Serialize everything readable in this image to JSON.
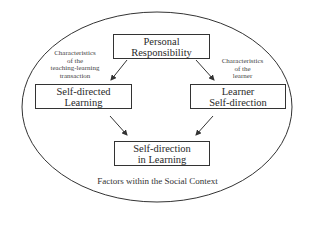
{
  "diagram": {
    "nodes": {
      "personal_responsibility": {
        "line1": "Personal",
        "line2": "Responsibility"
      },
      "self_directed_learning": {
        "line1": "Self-directed",
        "line2": "Learning"
      },
      "learner_self_direction": {
        "line1": "Learner",
        "line2": "Self-direction"
      },
      "self_direction_in_learning": {
        "line1": "Self-direction",
        "line2": "in Learning"
      }
    },
    "edge_labels": {
      "left": {
        "line1": "Characteristics",
        "line2": "of the",
        "line3": "teaching-learning",
        "line4": "transaction"
      },
      "right": {
        "line1": "Characteristics",
        "line2": "of the",
        "line3": "learner"
      }
    },
    "container_label": "Factors within the Social Context",
    "edges": [
      {
        "from": "personal_responsibility",
        "to": "self_directed_learning"
      },
      {
        "from": "personal_responsibility",
        "to": "learner_self_direction"
      },
      {
        "from": "self_directed_learning",
        "to": "self_direction_in_learning"
      },
      {
        "from": "learner_self_direction",
        "to": "self_direction_in_learning"
      }
    ]
  }
}
